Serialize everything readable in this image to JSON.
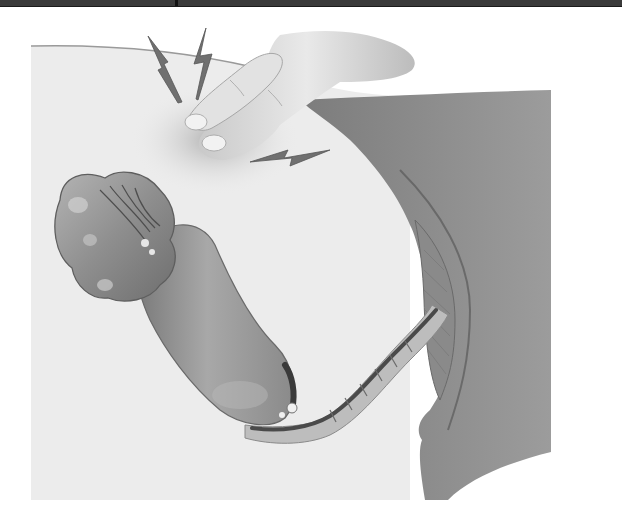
{
  "image": {
    "kind": "medical-illustration",
    "style": "grayscale pencil rendering",
    "subject": "Abdominal palpation with rebound tenderness over the right lower quadrant, showing cecum and appendix-like bowel segment leading to the colon",
    "elements": [
      {
        "name": "top-border-bar",
        "description": "dark horizontal border strip along the top edge"
      },
      {
        "name": "hand",
        "description": "two fingers pressing into the abdominal wall"
      },
      {
        "name": "pain-bolts",
        "description": "three zig-zag lightning bolt symbols indicating pain",
        "count": 3
      },
      {
        "name": "abdominal-wall",
        "description": "light gray body outline / cross-section background"
      },
      {
        "name": "cecum",
        "description": "lobulated organ with central fissure at left"
      },
      {
        "name": "bowel-segment",
        "description": "curved tubular bowel extending down and right"
      },
      {
        "name": "inflamed-tract",
        "description": "narrow ridged inflamed passage connecting to the right side"
      },
      {
        "name": "right-body-region",
        "description": "darker gray tissue region on the right with curved fold"
      }
    ]
  },
  "colors": {
    "background": "#ffffff",
    "body_light": "#ececec",
    "body_dark": "#8c8c8c",
    "organ": "#9a9a9a",
    "organ_shadow": "#5e5e5e",
    "bolt": "#6a6a6a",
    "skin": "#d6d6d6",
    "border": "#3a3a3a"
  }
}
